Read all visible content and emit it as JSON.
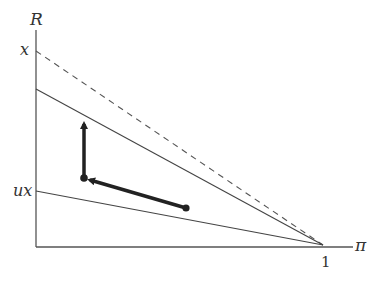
{
  "diagram": {
    "axes": {
      "y_label": "R",
      "x_label": "π",
      "y_ticks": [
        {
          "label": "x",
          "y": 51
        },
        {
          "label": "ux",
          "y": 191
        }
      ],
      "x_ticks": [
        {
          "label": "1",
          "x": 323
        }
      ]
    },
    "lines": [
      {
        "name": "dashed-line-x",
        "style": "dashed",
        "from": [
          36,
          51
        ],
        "to": [
          323,
          245
        ]
      },
      {
        "name": "upper-solid-line",
        "style": "solid",
        "from": [
          36,
          89
        ],
        "to": [
          323,
          245
        ]
      },
      {
        "name": "lower-solid-line-ux",
        "style": "solid",
        "from": [
          36,
          191
        ],
        "to": [
          323,
          245
        ]
      }
    ],
    "arrows": [
      {
        "name": "horizontal-arrow",
        "from": [
          186,
          208
        ],
        "to": [
          84,
          178
        ]
      },
      {
        "name": "vertical-arrow",
        "from": [
          84,
          178
        ],
        "to": [
          84,
          118
        ]
      }
    ],
    "points": [
      {
        "name": "start-point",
        "x": 186,
        "y": 208
      },
      {
        "name": "corner-point",
        "x": 84,
        "y": 178
      }
    ],
    "colors": {
      "axis": "#555555",
      "line": "#444444",
      "arrow": "#222222"
    }
  }
}
